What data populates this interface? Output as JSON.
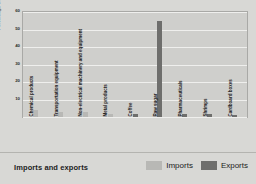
{
  "footer": {
    "title": "Imports and exports",
    "legend": [
      {
        "label": "Imports",
        "color": "#b8b8b5"
      },
      {
        "label": "Exports",
        "color": "#6e6e6c"
      }
    ]
  },
  "chart_data": {
    "type": "bar",
    "title": "Imports and exports",
    "xlabel": "",
    "ylabel": "Percentage of total",
    "ylim": [
      0,
      60
    ],
    "yticks": [
      0,
      10,
      20,
      30,
      40,
      50,
      60
    ],
    "ytick_labels": [
      "0",
      "10",
      "20",
      "30",
      "40",
      "50",
      "60"
    ],
    "grid": true,
    "legend_position": "bottom-right",
    "categories": [
      "Chemical products",
      "Transportation equipment",
      "Non-electrical machinery and equipment",
      "Metal products",
      "Coffee",
      "Raw sugar",
      "Pharmaceuticals",
      "Shrimps",
      "Cardboard boxes"
    ],
    "series": [
      {
        "name": "Imports",
        "color": "#b8b8b5",
        "values": [
          4,
          3,
          3,
          2,
          0,
          0,
          0,
          0,
          0
        ]
      },
      {
        "name": "Exports",
        "color": "#6e6e6c",
        "values": [
          0,
          0,
          0,
          0,
          2,
          55,
          2,
          2,
          1
        ]
      }
    ]
  }
}
